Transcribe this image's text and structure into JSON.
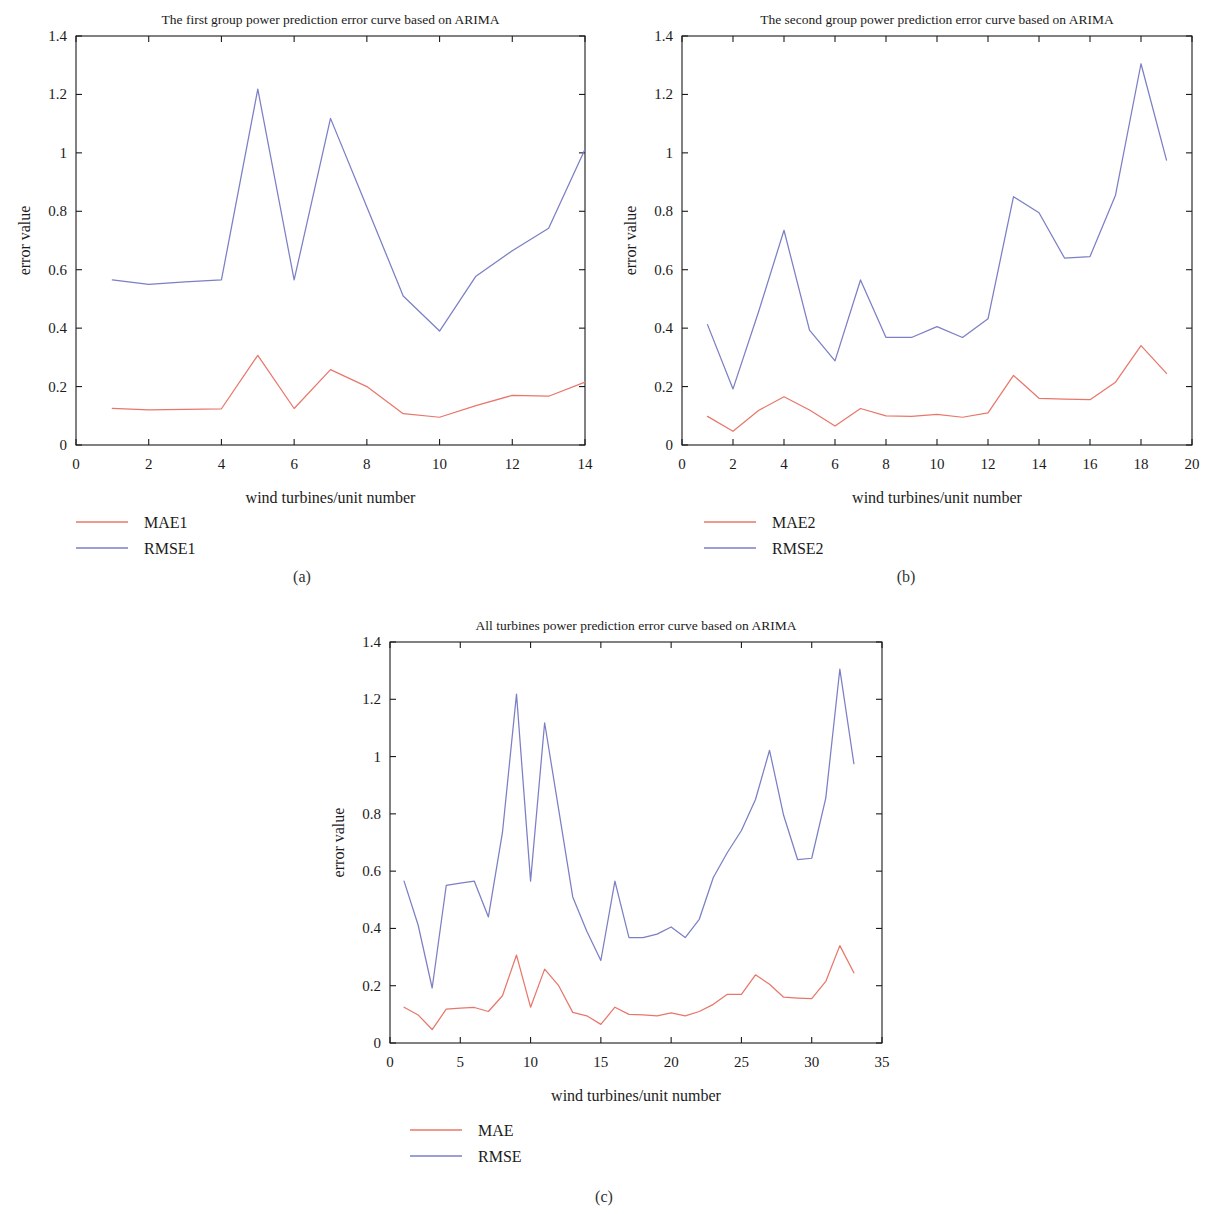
{
  "figure": {
    "panels": [
      {
        "id": "a",
        "caption": "(a)",
        "chart_data": {
          "type": "line",
          "title": "The first group power prediction error curve based on ARIMA",
          "xlabel": "wind turbines/unit number",
          "ylabel": "error value",
          "xlim": [
            0,
            14
          ],
          "ylim": [
            0,
            1.4
          ],
          "xticks": [
            0,
            2,
            4,
            6,
            8,
            10,
            12,
            14
          ],
          "xtick_labels": [
            "0",
            "2",
            "4",
            "6",
            "8",
            "10",
            "12",
            "14"
          ],
          "yticks": [
            0,
            0.2,
            0.4,
            0.6,
            0.8,
            1.0,
            1.2,
            1.4
          ],
          "ytick_labels": [
            "0",
            "0.2",
            "0.4",
            "0.6",
            "0.8",
            "1",
            "1.2",
            "1.4"
          ],
          "grid": false,
          "legend_position": "below-left",
          "x": [
            1,
            2,
            3,
            4,
            5,
            6,
            7,
            8,
            9,
            10,
            11,
            12,
            13,
            14
          ],
          "series": [
            {
              "name": "MAE1",
              "color": "#e8776b",
              "values": [
                0.125,
                0.12,
                0.122,
                0.124,
                0.307,
                0.125,
                0.258,
                0.2,
                0.107,
                0.095,
                0.135,
                0.17,
                0.167,
                0.215
              ]
            },
            {
              "name": "RMSE1",
              "color": "#7b7fc4",
              "values": [
                0.565,
                0.55,
                0.558,
                0.565,
                1.218,
                0.565,
                1.118,
                0.815,
                0.51,
                0.39,
                0.578,
                0.665,
                0.742,
                1.012
              ]
            }
          ]
        }
      },
      {
        "id": "b",
        "caption": "(b)",
        "chart_data": {
          "type": "line",
          "title": "The second group power prediction error curve based on ARIMA",
          "xlabel": "wind turbines/unit number",
          "ylabel": "error value",
          "xlim": [
            0,
            20
          ],
          "ylim": [
            0,
            1.4
          ],
          "xticks": [
            0,
            2,
            4,
            6,
            8,
            10,
            12,
            14,
            16,
            18,
            20
          ],
          "xtick_labels": [
            "0",
            "2",
            "4",
            "6",
            "8",
            "10",
            "12",
            "14",
            "16",
            "18",
            "20"
          ],
          "yticks": [
            0,
            0.2,
            0.4,
            0.6,
            0.8,
            1.0,
            1.2,
            1.4
          ],
          "ytick_labels": [
            "0",
            "0.2",
            "0.4",
            "0.6",
            "0.8",
            "1",
            "1.2",
            "1.4"
          ],
          "grid": false,
          "legend_position": "below-left",
          "x": [
            1,
            2,
            3,
            4,
            5,
            6,
            7,
            8,
            9,
            10,
            11,
            12,
            13,
            14,
            15,
            16,
            17,
            18,
            19
          ],
          "series": [
            {
              "name": "MAE2",
              "color": "#e8776b",
              "values": [
                0.098,
                0.047,
                0.118,
                0.165,
                0.12,
                0.065,
                0.125,
                0.1,
                0.098,
                0.105,
                0.095,
                0.11,
                0.238,
                0.16,
                0.157,
                0.155,
                0.215,
                0.34,
                0.245
              ]
            },
            {
              "name": "RMSE2",
              "color": "#7b7fc4",
              "values": [
                0.412,
                0.192,
                0.455,
                0.735,
                0.393,
                0.288,
                0.565,
                0.368,
                0.368,
                0.405,
                0.368,
                0.432,
                0.85,
                0.795,
                0.64,
                0.645,
                0.855,
                1.305,
                0.975
              ]
            }
          ]
        }
      },
      {
        "id": "c",
        "caption": "(c)",
        "chart_data": {
          "type": "line",
          "title": "All turbines power prediction error curve based on ARIMA",
          "xlabel": "wind turbines/unit number",
          "ylabel": "error value",
          "xlim": [
            0,
            35
          ],
          "ylim": [
            0,
            1.4
          ],
          "xticks": [
            0,
            5,
            10,
            15,
            20,
            25,
            30,
            35
          ],
          "xtick_labels": [
            "0",
            "5",
            "10",
            "15",
            "20",
            "25",
            "30",
            "35"
          ],
          "yticks": [
            0,
            0.2,
            0.4,
            0.6,
            0.8,
            1.0,
            1.2,
            1.4
          ],
          "ytick_labels": [
            "0",
            "0.2",
            "0.4",
            "0.6",
            "0.8",
            "1",
            "1.2",
            "1.4"
          ],
          "grid": false,
          "legend_position": "below-left",
          "x": [
            1,
            2,
            3,
            4,
            5,
            6,
            7,
            8,
            9,
            10,
            11,
            12,
            13,
            14,
            15,
            16,
            17,
            18,
            19,
            20,
            21,
            22,
            23,
            24,
            25,
            26,
            27,
            28,
            29,
            30,
            31,
            32,
            33
          ],
          "series": [
            {
              "name": "MAE",
              "color": "#e8776b",
              "values": [
                0.125,
                0.098,
                0.047,
                0.118,
                0.122,
                0.124,
                0.11,
                0.165,
                0.307,
                0.125,
                0.258,
                0.2,
                0.107,
                0.095,
                0.065,
                0.125,
                0.1,
                0.098,
                0.095,
                0.105,
                0.095,
                0.11,
                0.135,
                0.17,
                0.17,
                0.238,
                0.205,
                0.16,
                0.157,
                0.155,
                0.215,
                0.34,
                0.245
              ]
            },
            {
              "name": "RMSE",
              "color": "#7b7fc4",
              "values": [
                0.565,
                0.412,
                0.192,
                0.55,
                0.558,
                0.565,
                0.44,
                0.735,
                1.218,
                0.565,
                1.118,
                0.815,
                0.51,
                0.39,
                0.288,
                0.565,
                0.368,
                0.368,
                0.38,
                0.405,
                0.368,
                0.432,
                0.578,
                0.665,
                0.742,
                0.85,
                1.022,
                0.795,
                0.64,
                0.645,
                0.855,
                1.305,
                0.975
              ]
            }
          ]
        }
      }
    ]
  }
}
